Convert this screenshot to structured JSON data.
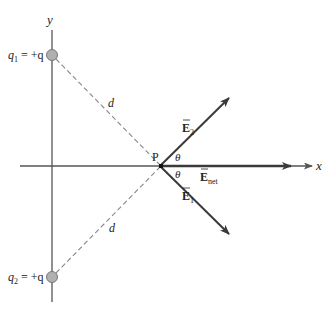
{
  "diagram": {
    "axes": {
      "x_label": "x",
      "y_label": "y"
    },
    "charges": [
      {
        "name": "q1",
        "label_sym": "q",
        "label_sub": "1",
        "label_rest": " = +q"
      },
      {
        "name": "q2",
        "label_sym": "q",
        "label_sub": "2",
        "label_rest": " = +q"
      }
    ],
    "point": {
      "label": "P"
    },
    "distances": [
      {
        "label": "d"
      },
      {
        "label": "d"
      }
    ],
    "angles": [
      {
        "label": "θ"
      },
      {
        "label": "θ"
      }
    ],
    "vectors": [
      {
        "name": "E2",
        "sym": "E",
        "sub": "2"
      },
      {
        "name": "Enet",
        "sym": "E",
        "sub": "net"
      },
      {
        "name": "E1",
        "sym": "E",
        "sub": "1"
      }
    ],
    "colors": {
      "axis": "#555555",
      "vector": "#3a3a3a",
      "dashed": "#888888",
      "charge_fill": "#b0b0b0",
      "charge_stroke": "#777777"
    }
  }
}
